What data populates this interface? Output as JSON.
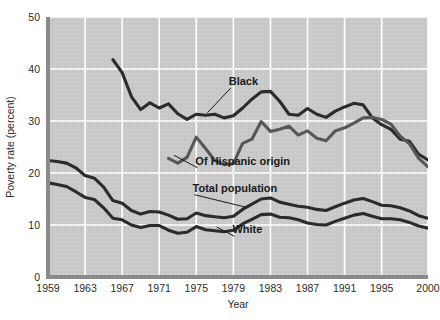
{
  "chart_data": {
    "type": "line",
    "title": "",
    "xlabel": "Year",
    "ylabel": "Poverty rate (percent)",
    "xlim": [
      1959,
      2000
    ],
    "ylim": [
      0,
      50
    ],
    "xticks": [
      "1959",
      "1963",
      "1967",
      "1971",
      "1975",
      "1979",
      "1983",
      "1987",
      "1991",
      "1995",
      "2000"
    ],
    "xtick_values": [
      1959,
      1963,
      1967,
      1971,
      1975,
      1979,
      1983,
      1987,
      1991,
      1995,
      2000
    ],
    "yticks": [
      "0",
      "10",
      "20",
      "30",
      "40",
      "50"
    ],
    "ytick_values": [
      0,
      10,
      20,
      30,
      40,
      50
    ],
    "grid": true,
    "grid_color": "#ffffff",
    "plot_background": "#c9c9c9",
    "legend_position": "inline-annotations",
    "series": [
      {
        "name": "Black",
        "label": "Black",
        "color": "#2b2b2b",
        "x": [
          1966,
          1967,
          1968,
          1969,
          1970,
          1971,
          1972,
          1973,
          1974,
          1975,
          1976,
          1977,
          1978,
          1979,
          1980,
          1981,
          1982,
          1983,
          1984,
          1985,
          1986,
          1987,
          1988,
          1989,
          1990,
          1991,
          1992,
          1993,
          1994,
          1995,
          1996,
          1997,
          1998,
          1999,
          2000
        ],
        "values": [
          41.8,
          39.3,
          34.7,
          32.2,
          33.5,
          32.5,
          33.3,
          31.4,
          30.3,
          31.3,
          31.1,
          31.3,
          30.6,
          31.0,
          32.5,
          34.2,
          35.6,
          35.7,
          33.8,
          31.3,
          31.1,
          32.4,
          31.3,
          30.7,
          31.9,
          32.7,
          33.4,
          33.1,
          30.6,
          29.3,
          28.4,
          26.5,
          26.1,
          23.6,
          22.5
        ]
      },
      {
        "name": "Of Hispanic origin",
        "label": "Of Hispanic origin",
        "color": "#575757",
        "x": [
          1972,
          1973,
          1974,
          1975,
          1976,
          1977,
          1978,
          1979,
          1980,
          1981,
          1982,
          1983,
          1984,
          1985,
          1986,
          1987,
          1988,
          1989,
          1990,
          1991,
          1992,
          1993,
          1994,
          1995,
          1996,
          1997,
          1998,
          1999,
          2000
        ],
        "values": [
          22.8,
          21.9,
          23.0,
          26.9,
          24.7,
          22.4,
          21.6,
          21.8,
          25.7,
          26.5,
          29.9,
          28.0,
          28.4,
          29.0,
          27.3,
          28.1,
          26.7,
          26.2,
          28.1,
          28.7,
          29.6,
          30.6,
          30.7,
          30.3,
          29.4,
          27.1,
          25.6,
          22.8,
          21.2
        ]
      },
      {
        "name": "Total population",
        "label": "Total population",
        "color": "#2b2b2b",
        "x": [
          1959,
          1960,
          1961,
          1962,
          1963,
          1964,
          1965,
          1966,
          1967,
          1968,
          1969,
          1970,
          1971,
          1972,
          1973,
          1974,
          1975,
          1976,
          1977,
          1978,
          1979,
          1980,
          1981,
          1982,
          1983,
          1984,
          1985,
          1986,
          1987,
          1988,
          1989,
          1990,
          1991,
          1992,
          1993,
          1994,
          1995,
          1996,
          1997,
          1998,
          1999,
          2000
        ],
        "values": [
          22.4,
          22.2,
          21.9,
          21.0,
          19.5,
          19.0,
          17.3,
          14.7,
          14.2,
          12.8,
          12.1,
          12.6,
          12.5,
          11.9,
          11.1,
          11.2,
          12.3,
          11.8,
          11.6,
          11.4,
          11.7,
          13.0,
          14.0,
          15.0,
          15.2,
          14.4,
          14.0,
          13.6,
          13.4,
          13.0,
          12.8,
          13.5,
          14.2,
          14.8,
          15.1,
          14.5,
          13.8,
          13.7,
          13.3,
          12.7,
          11.8,
          11.3
        ]
      },
      {
        "name": "White",
        "label": "White",
        "color": "#2b2b2b",
        "x": [
          1959,
          1960,
          1961,
          1962,
          1963,
          1964,
          1965,
          1966,
          1967,
          1968,
          1969,
          1970,
          1971,
          1972,
          1973,
          1974,
          1975,
          1976,
          1977,
          1978,
          1979,
          1980,
          1981,
          1982,
          1983,
          1984,
          1985,
          1986,
          1987,
          1988,
          1989,
          1990,
          1991,
          1992,
          1993,
          1994,
          1995,
          1996,
          1997,
          1998,
          1999,
          2000
        ],
        "values": [
          18.1,
          17.8,
          17.4,
          16.4,
          15.3,
          14.9,
          13.3,
          11.3,
          11.0,
          10.0,
          9.5,
          9.9,
          9.9,
          9.0,
          8.4,
          8.6,
          9.7,
          9.1,
          8.9,
          8.7,
          9.0,
          10.2,
          11.1,
          12.0,
          12.1,
          11.5,
          11.4,
          11.0,
          10.4,
          10.1,
          10.0,
          10.7,
          11.3,
          11.9,
          12.2,
          11.7,
          11.2,
          11.2,
          11.0,
          10.5,
          9.8,
          9.4
        ]
      }
    ],
    "annotations": [
      {
        "text": "Black",
        "x": 1978.5,
        "y": 36.9,
        "leader_to_x": 1976.2,
        "leader_to_y": 31.6
      },
      {
        "text": "Of Hispanic origin",
        "x": 1974.9,
        "y": 21.6,
        "leader_to_x": 1972.6,
        "leader_to_y": 23.4
      },
      {
        "text": "Total population",
        "x": 1974.6,
        "y": 16.4,
        "leader_to_x": 1980.4,
        "leader_to_y": 13.4
      },
      {
        "text": "White",
        "x": 1978.9,
        "y": 8.4,
        "leader_to_x": 1977.2,
        "leader_to_y": 9.6
      }
    ]
  }
}
